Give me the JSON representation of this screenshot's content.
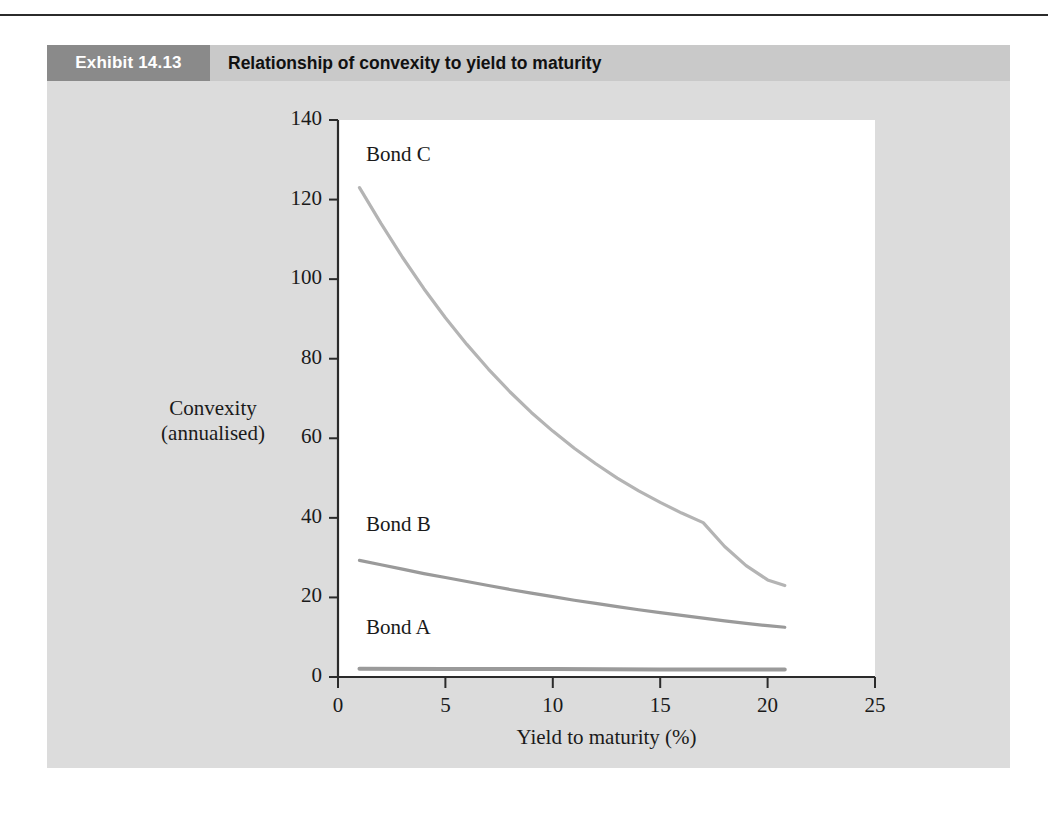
{
  "exhibit": {
    "number_label": "Exhibit 14.13",
    "title": "Relationship of convexity to yield to maturity",
    "header_box_color": "#8a8a8a",
    "header_bar_color": "#c9c9c9",
    "panel_color": "#dcdcdc"
  },
  "chart_data": {
    "type": "line",
    "title": "Relationship of convexity to yield to maturity",
    "xlabel": "Yield to maturity (%)",
    "ylabel": "Convexity (annualised)",
    "ylabel_line1": "Convexity",
    "ylabel_line2": "(annualised)",
    "xlim": [
      0,
      25
    ],
    "ylim": [
      0,
      140
    ],
    "xticks": [
      "0",
      "5",
      "10",
      "15",
      "20",
      "25"
    ],
    "xtick_values": [
      0,
      5,
      10,
      15,
      20,
      25
    ],
    "yticks": [
      "0",
      "20",
      "40",
      "60",
      "80",
      "100",
      "120",
      "140"
    ],
    "ytick_values": [
      0,
      20,
      40,
      60,
      80,
      100,
      120,
      140
    ],
    "grid": false,
    "legend": "inline-labels",
    "series": [
      {
        "name": "Bond C",
        "label": "Bond C",
        "color": "#b4b4b4",
        "x": [
          1,
          2,
          3,
          4,
          5,
          6,
          7,
          8,
          9,
          10,
          11,
          12,
          13,
          14,
          15,
          16,
          17,
          18,
          19,
          20,
          20.8
        ],
        "values": [
          123,
          114,
          105.5,
          97.6,
          90.3,
          83.6,
          77.4,
          71.7,
          66.5,
          61.8,
          57.5,
          53.6,
          50.0,
          46.8,
          43.9,
          41.2,
          38.8,
          32.8,
          28.0,
          24.4,
          23.0
        ]
      },
      {
        "name": "Bond B",
        "label": "Bond B",
        "color": "#9a9a9a",
        "x": [
          1,
          2,
          3,
          4,
          5,
          6,
          7,
          8,
          9,
          10,
          11,
          12,
          13,
          14,
          15,
          16,
          17,
          18,
          19,
          20,
          20.8
        ],
        "values": [
          29.3,
          28.2,
          27.1,
          26.0,
          25.0,
          24.0,
          23.0,
          22.0,
          21.1,
          20.2,
          19.3,
          18.5,
          17.7,
          16.9,
          16.2,
          15.5,
          14.8,
          14.1,
          13.5,
          12.9,
          12.5
        ]
      },
      {
        "name": "Bond A",
        "label": "Bond A",
        "color": "#9a9a9a",
        "x": [
          1,
          5,
          10,
          15,
          20,
          20.8
        ],
        "values": [
          2.1,
          2.0,
          2.0,
          1.9,
          1.9,
          1.9
        ]
      }
    ],
    "series_label_positions": [
      {
        "name": "Bond C",
        "x": 1.3,
        "y": 131
      },
      {
        "name": "Bond B",
        "x": 1.3,
        "y": 38
      },
      {
        "name": "Bond A",
        "x": 1.3,
        "y": 12
      }
    ]
  }
}
